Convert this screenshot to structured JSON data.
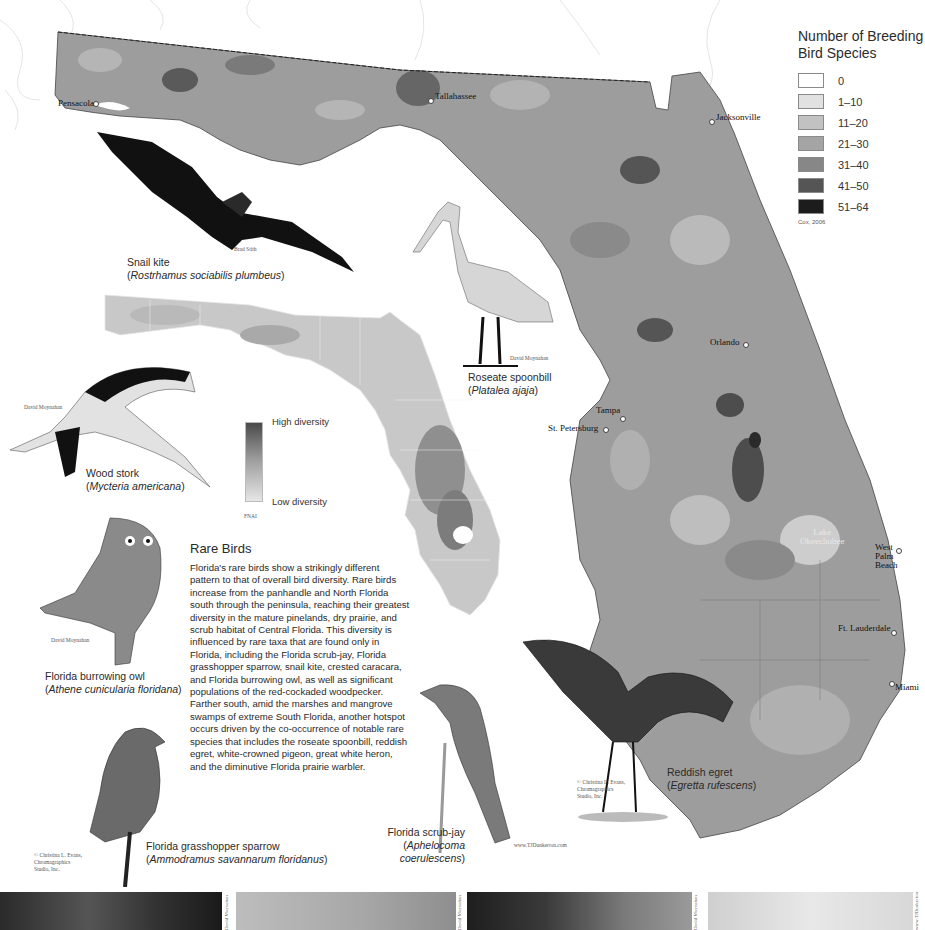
{
  "legend": {
    "title_line1": "Number of Breeding",
    "title_line2": "Bird Species",
    "items": [
      {
        "label": "0",
        "color": "#ffffff"
      },
      {
        "label": "1–10",
        "color": "#e1e1e1"
      },
      {
        "label": "11–20",
        "color": "#c2c2c2"
      },
      {
        "label": "21–30",
        "color": "#a4a4a4"
      },
      {
        "label": "31–40",
        "color": "#878787"
      },
      {
        "label": "41–50",
        "color": "#555555"
      },
      {
        "label": "51–64",
        "color": "#1c1c1c"
      }
    ],
    "source": "Cox, 2006"
  },
  "cities": [
    {
      "name": "Pensacola"
    },
    {
      "name": "Tallahassee"
    },
    {
      "name": "Jacksonville"
    },
    {
      "name": "Orlando"
    },
    {
      "name": "Tampa"
    },
    {
      "name": "St. Petersburg"
    },
    {
      "name": "West Palm Beach",
      "line1": "West",
      "line2": "Palm",
      "line3": "Beach"
    },
    {
      "name": "Ft. Lauderdale"
    },
    {
      "name": "Miami"
    }
  ],
  "lake_label": {
    "line1": "Lake",
    "line2": "Okeechobee"
  },
  "birds": {
    "snail_kite": {
      "common": "Snail kite",
      "scientific": "Rostrhamus sociabilis plumbeus",
      "credit": "Brad Stith"
    },
    "roseate_spoonbill": {
      "common": "Roseate spoonbill",
      "scientific": "Platalea ajaja",
      "credit": "David Moynahan"
    },
    "wood_stork": {
      "common": "Wood stork",
      "scientific": "Mycteria americana",
      "credit": "David Moynahan"
    },
    "burrowing_owl": {
      "common": "Florida burrowing owl",
      "scientific": "Athene cunicularia floridana",
      "credit": "David Moynahan"
    },
    "grasshopper_sparrow": {
      "common": "Florida grasshopper sparrow",
      "scientific": "Ammodramus savannarum floridanus",
      "credit_line1": "© Christina L. Evans,",
      "credit_line2": "Chromagraphics",
      "credit_line3": "Studio, Inc."
    },
    "scrub_jay": {
      "common": "Florida scrub-jay",
      "scientific_line1": "Aphelocoma",
      "scientific_line2": "coerulescens",
      "credit": "www.TJDunkerton.com"
    },
    "reddish_egret": {
      "common": "Reddish egret",
      "scientific": "Egretta rufescens",
      "credit_line1": "© Christina L. Evans,",
      "credit_line2": "Chromagraphics",
      "credit_line3": "Studio, Inc."
    }
  },
  "diversity_legend": {
    "high": "High diversity",
    "low": "Low diversity",
    "source": "FNAI"
  },
  "rare_birds": {
    "title": "Rare Birds",
    "body": "Florida's rare birds show a strikingly different pattern to that of overall bird diversity. Rare birds increase from the panhandle and North Florida south through the peninsula, reaching their greatest diversity in the mature pinelands, dry prairie, and scrub habitat of Central Florida. This diversity is influenced by rare taxa that are found only in Florida, including the Florida scrub-jay, Florida grasshopper sparrow, snail kite, crested caracara, and Florida burrowing owl, as well as significant populations of the red-cockaded woodpecker. Farther south, amid the marshes and mangrove swamps of extreme South Florida, another hotspot occurs driven by the co-occurrence of notable rare species that includes the roseate spoonbill, reddish egret, white-crowned pigeon, great white heron, and the diminutive Florida prairie warbler."
  },
  "photo_strip": {
    "credits": [
      "David Moynahan",
      "David Moynahan",
      "David Moynahan",
      "www.TJDunkerton.com"
    ]
  }
}
